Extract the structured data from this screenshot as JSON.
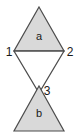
{
  "diagram": {
    "background_color": "#ffffff",
    "stroke_color": "#4d4d4d",
    "fill_shaded": "#d9d9d9",
    "fill_open": "#ffffff",
    "stroke_width": 1.2,
    "faces": [
      {
        "id": "face-a",
        "label": "a",
        "shading": "shaded",
        "orientation": "apex-up",
        "label_x": 39,
        "label_y": 40
      },
      {
        "id": "face-middle",
        "label": "",
        "shading": "open",
        "orientation": "apex-down",
        "label_x": 39,
        "label_y": 70
      },
      {
        "id": "face-b",
        "label": "b",
        "shading": "shaded",
        "orientation": "apex-up",
        "label_x": 39,
        "label_y": 117
      }
    ],
    "vertices": [
      {
        "id": "vertex-1",
        "label": "1",
        "point_x": 14,
        "point_y": 51,
        "label_x": 8,
        "label_y": 56
      },
      {
        "id": "vertex-2",
        "label": "2",
        "point_x": 64,
        "point_y": 51,
        "label_x": 67,
        "label_y": 56
      },
      {
        "id": "vertex-3",
        "label": "3",
        "point_x": 39,
        "point_y": 87,
        "label_x": 45,
        "label_y": 95
      }
    ],
    "polygons": {
      "triangle_a": "39,7 64,51 14,51",
      "triangle_middle": "14,51 64,51 39,93",
      "triangle_b": "39,86 64,131 14,131"
    }
  }
}
